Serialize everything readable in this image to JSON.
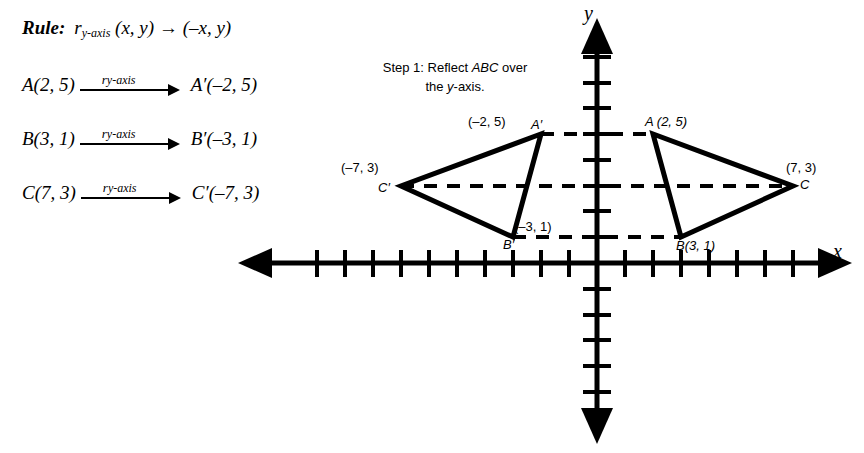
{
  "rule": {
    "keyword": "Rule:",
    "mapping_name": "r",
    "mapping_subscript": "y-axis",
    "preimage": "(x, y)",
    "arrow": "→",
    "image": "(–x, y)",
    "full_text": "Rule:  r y-axis (x, y) → (–x, y)"
  },
  "mappings": [
    {
      "source": "A(2, 5)",
      "label_r": "r",
      "label_sub": "y-axis",
      "target": "A′(–2, 5)"
    },
    {
      "source": "B(3, 1)",
      "label_r": "r",
      "label_sub": "y-axis",
      "target": "B′(–3, 1)"
    },
    {
      "source": "C(7, 3)",
      "label_r": "r",
      "label_sub": "y-axis",
      "target": "C′(–7, 3)"
    }
  ],
  "step": {
    "line1_prefix": "Step 1: Reflect ",
    "line1_italic": "ABC",
    "line1_suffix": " over",
    "line2_prefix": "the ",
    "line2_italic": "y",
    "line2_suffix": "-axis."
  },
  "graph": {
    "x_axis_label": "x",
    "y_axis_label": "y",
    "origin_px": {
      "x": 597,
      "y": 263
    },
    "unit_px": {
      "x": 27.9,
      "y": 25.8
    },
    "x_ticks_negative": 10,
    "x_ticks_positive": 7,
    "y_ticks_positive": 8,
    "y_ticks_negative": 5,
    "points": [
      {
        "name": "A",
        "coord_label": "A (2, 5)",
        "x": 2,
        "y": 5,
        "label_pos": "above-right"
      },
      {
        "name": "B",
        "coord_label": "B(3, 1)",
        "x": 3,
        "y": 1,
        "label_pos": "below-right"
      },
      {
        "name": "C",
        "coord_label": "(7, 3)",
        "vertex_label": "C",
        "x": 7,
        "y": 3,
        "label_pos": "right"
      },
      {
        "name": "A'",
        "coord_label": "(–2, 5)",
        "vertex_label": "A′",
        "x": -2,
        "y": 5,
        "label_pos": "above-left"
      },
      {
        "name": "B'",
        "coord_label": "(–3, 1)",
        "vertex_label": "B′",
        "x": -3,
        "y": 1,
        "label_pos": "above-right"
      },
      {
        "name": "C'",
        "coord_label": "(–7, 3)",
        "vertex_label": "C′",
        "x": -7,
        "y": 3,
        "label_pos": "above-left"
      }
    ],
    "triangles": [
      {
        "name": "ABC",
        "vertices": [
          [
            2,
            5
          ],
          [
            3,
            1
          ],
          [
            7,
            3
          ]
        ]
      },
      {
        "name": "A'B'C'",
        "vertices": [
          [
            -2,
            5
          ],
          [
            -3,
            1
          ],
          [
            -7,
            3
          ]
        ]
      }
    ],
    "dashed_connectors": [
      {
        "from": [
          -2,
          5
        ],
        "to": [
          2,
          5
        ]
      },
      {
        "from": [
          -7,
          3
        ],
        "to": [
          7,
          3
        ]
      },
      {
        "from": [
          -3,
          1
        ],
        "to": [
          3,
          1
        ]
      }
    ]
  },
  "colors": {
    "ink": "#000000",
    "background": "#ffffff"
  }
}
